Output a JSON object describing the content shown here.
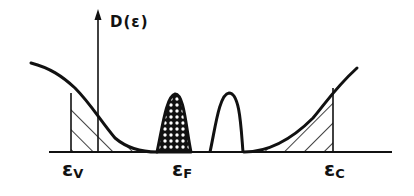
{
  "diagram": {
    "type": "density-of-states",
    "colors": {
      "ink": "#111111",
      "background": "#ffffff"
    },
    "axis": {
      "ylabel": "D(ε)",
      "arrow": true
    },
    "energy_labels": [
      {
        "id": "valence",
        "symbol": "ε",
        "sub": "V"
      },
      {
        "id": "fermi",
        "symbol": "ε",
        "sub": "F"
      },
      {
        "id": "conduction",
        "symbol": "ε",
        "sub": "C"
      }
    ],
    "regions": [
      {
        "name": "valence-band-tail",
        "fill": "diagonal-hatch",
        "bounded_by": "εV"
      },
      {
        "name": "occupied-impurity-band",
        "fill": "cross-hatch",
        "at": "εF"
      },
      {
        "name": "empty-impurity-band",
        "fill": "none"
      },
      {
        "name": "conduction-band-tail",
        "fill": "diagonal-hatch",
        "bounded_by": "εC"
      }
    ]
  }
}
